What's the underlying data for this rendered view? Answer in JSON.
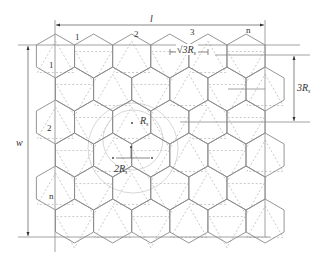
{
  "diagram": {
    "type": "hexagonal-tiling-layout",
    "geometry": {
      "hex_radius_px": 22,
      "origin_x": 55.5,
      "origin_y": 56,
      "col_pitch": 38.1,
      "row_pitch": 33,
      "rows": 6,
      "cols": 6
    },
    "column_labels": [
      {
        "text": "1",
        "x": 75,
        "y": 40
      },
      {
        "text": "2",
        "x": 134,
        "y": 37
      },
      {
        "text": "3",
        "x": 190,
        "y": 35
      },
      {
        "text": "n",
        "x": 246,
        "y": 33
      }
    ],
    "row_labels": [
      {
        "text": "1",
        "x": 49,
        "y": 68
      },
      {
        "text": "2",
        "x": 47,
        "y": 131
      },
      {
        "text": "n",
        "x": 49,
        "y": 199
      }
    ],
    "dimensions": {
      "length_label": "l",
      "width_label": "w",
      "pitch_x_label": "√3R",
      "pitch_x_sub": "s",
      "pitch_y_label": "3R",
      "pitch_y_sub": "s",
      "radius_label": "R",
      "radius_sub": "s",
      "diameter_label": "2R",
      "diameter_sub": "s"
    },
    "colors": {
      "hex_stroke": "#8a8a8a",
      "triangle_stroke": "#c4c4c4",
      "circle_stroke": "#d2d2d2",
      "text": "#333333"
    }
  }
}
